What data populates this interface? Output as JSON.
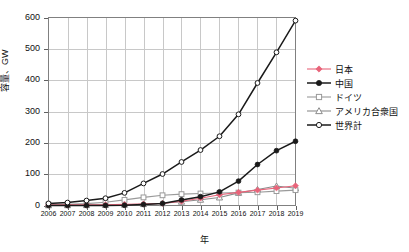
{
  "chart_data": {
    "type": "line",
    "title": "",
    "xlabel": "年",
    "ylabel": "容量、GW",
    "xlim": [
      2006,
      2019
    ],
    "ylim": [
      0,
      600
    ],
    "yticks": [
      0,
      100,
      200,
      300,
      400,
      500,
      600
    ],
    "grid": true,
    "legend_position": "right",
    "categories": [
      "2006",
      "2007",
      "2008",
      "2009",
      "2010",
      "2011",
      "2012",
      "2013",
      "2014",
      "2015",
      "2016",
      "2017",
      "2018",
      "2019"
    ],
    "series": [
      {
        "name": "日本",
        "color": "#E8647A",
        "marker": "diamond-filled",
        "values": [
          1.7,
          1.9,
          2.1,
          2.6,
          3.6,
          4.9,
          6.6,
          13.6,
          23.3,
          34.2,
          42.0,
          49.0,
          56.0,
          63.0
        ]
      },
      {
        "name": "中国",
        "color": "#1A1A1A",
        "marker": "circle-filled",
        "values": [
          0.1,
          0.1,
          0.1,
          0.3,
          0.8,
          3.3,
          6.7,
          17.7,
          28.2,
          43.5,
          77.8,
          130.8,
          175.0,
          205.0
        ]
      },
      {
        "name": "ドイツ",
        "color": "#9A9A9A",
        "marker": "square-open",
        "values": [
          2.9,
          4.2,
          6.1,
          10.6,
          18.0,
          25.9,
          32.6,
          36.3,
          38.2,
          39.7,
          41.2,
          42.3,
          45.9,
          49.0
        ]
      },
      {
        "name": "アメリカ合衆国",
        "color": "#8C8C8C",
        "marker": "triangle-open",
        "values": [
          0.6,
          0.9,
          1.2,
          1.6,
          2.5,
          4.4,
          7.3,
          12.1,
          18.3,
          25.6,
          40.3,
          51.0,
          62.0,
          55.0
        ]
      },
      {
        "name": "世界計",
        "color": "#1A1A1A",
        "marker": "circle-open",
        "values": [
          6.7,
          9.4,
          15.8,
          23.2,
          40.3,
          70.5,
          100.5,
          138.9,
          177.0,
          221.0,
          291.0,
          391.0,
          489.0,
          590.0
        ]
      }
    ]
  },
  "axis": {
    "y_label": "容量、GW",
    "x_label": "年",
    "y_ticks": [
      "0",
      "100",
      "200",
      "300",
      "400",
      "500",
      "600"
    ],
    "x_ticks": [
      "2006",
      "2007",
      "2008",
      "2009",
      "2010",
      "2011",
      "2012",
      "2013",
      "2014",
      "2015",
      "2016",
      "2017",
      "2018",
      "2019"
    ]
  },
  "legend": {
    "items": [
      {
        "label": "日本"
      },
      {
        "label": "中国"
      },
      {
        "label": "ドイツ"
      },
      {
        "label": "アメリカ合衆国"
      },
      {
        "label": "世界計"
      }
    ]
  }
}
